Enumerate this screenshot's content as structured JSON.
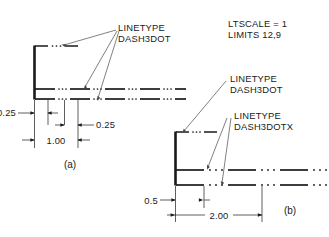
{
  "drawing": {
    "title_note": {
      "ltscale": "LTSCALE  =  1",
      "limits": "LIMITS  12,9"
    },
    "colors": {
      "line": "#1a1a1a",
      "background": "#ffffff",
      "leader": "#303030"
    },
    "figures": [
      {
        "id": "a",
        "caption": "(a)",
        "annotation": {
          "line1": "LINETYPE",
          "line2": "DASH3DOT"
        },
        "dimensions": [
          {
            "name": "dash-gap-left",
            "value": "0.25"
          },
          {
            "name": "dot-spacing",
            "value": "0.25"
          },
          {
            "name": "pattern-length",
            "value": "1.00"
          }
        ]
      },
      {
        "id": "b",
        "caption": "(b)",
        "annotations": [
          {
            "name": "dash3dot",
            "line1": "LINETYPE",
            "line2": "DASH3DOT"
          },
          {
            "name": "dash3dotx",
            "line1": "LINETYPE",
            "line2": "DASH3DOTX"
          }
        ],
        "dimensions": [
          {
            "name": "dash-gap-left",
            "value": "0.5"
          },
          {
            "name": "pattern-length",
            "value": "2.00"
          }
        ]
      }
    ]
  }
}
